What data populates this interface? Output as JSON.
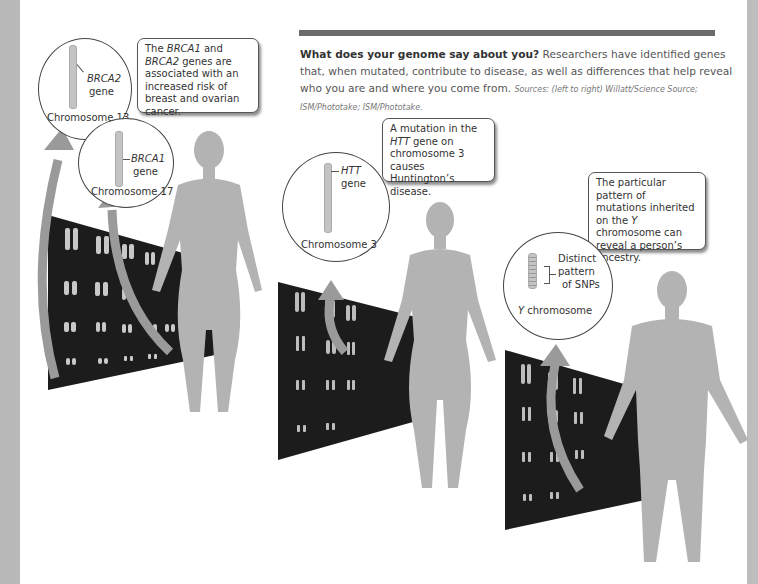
{
  "caption": {
    "title": "What does your genome say about you?",
    "body": " Researchers have identified genes that, when mutated, contribute to disease, as well as differences that help reveal who you are and where you come from. ",
    "sources": "Sources: (left to right) Willatt/Science Source; ISM/Phototake; ISM/Phototake."
  },
  "panel1": {
    "callout": {
      "pre": "The ",
      "g1": "BRCA1",
      "mid": " and ",
      "g2": "BRCA2",
      "post": " genes are associated with an increased risk of breast and ovarian cancer."
    },
    "circle_a": {
      "gene": "BRCA2",
      "gene_word": "gene",
      "label": "Chromosome 13"
    },
    "circle_b": {
      "gene": "BRCA1",
      "gene_word": "gene",
      "label": "Chromosome 17"
    },
    "karyotype_numbers": [
      "1",
      "2",
      "3",
      "4",
      "5",
      "6",
      "7",
      "8",
      "9",
      "10",
      "11",
      "12",
      "13",
      "14",
      "15",
      "16",
      "17",
      "18",
      "19",
      "20",
      "21",
      "22",
      "X"
    ]
  },
  "panel2": {
    "callout": {
      "pre": "A mutation in the ",
      "g1": "HTT",
      "post": " gene on chromosome 3 causes Huntington’s disease."
    },
    "circle": {
      "gene": "HTT",
      "gene_word": "gene",
      "label": "Chromosome 3"
    }
  },
  "panel3": {
    "callout": {
      "pre": "The particular pattern of mutations inherited on the ",
      "g1": "Y",
      "post": " chromosome can reveal a person’s ancestry."
    },
    "circle": {
      "desc1": "Distinct",
      "desc2": "pattern",
      "desc3": "of SNPs",
      "label_italic": "Y",
      "label": " chromosome"
    }
  },
  "colors": {
    "silhouette": "#b3b3b3",
    "arrow": "#9a9a9a",
    "karyotype_bg": "#1c1c1c",
    "bar": "#6b6b6b"
  }
}
